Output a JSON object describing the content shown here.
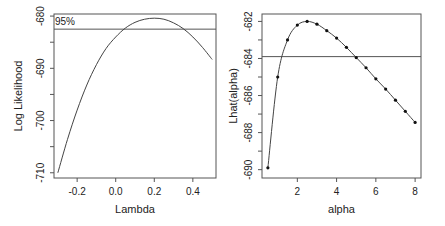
{
  "chart_data": [
    {
      "type": "line",
      "title": "",
      "xlabel": "Lambda",
      "ylabel": "Log Likelihood",
      "xlim": [
        -0.32,
        0.52
      ],
      "ylim": [
        -711,
        -679.6
      ],
      "xticks": [
        -0.2,
        0.0,
        0.2,
        0.4
      ],
      "xtick_labels": [
        "-0.2",
        "0.0",
        "0.2",
        "0.4"
      ],
      "yticks": [
        -680,
        -685,
        -690,
        -695,
        -700,
        -705,
        -710
      ],
      "ytick_labels": [
        "-680",
        "",
        "-690",
        "",
        "-700",
        "",
        "-710"
      ],
      "series": [
        {
          "name": "profile log-likelihood",
          "x": [
            -0.3,
            -0.25,
            -0.2,
            -0.15,
            -0.1,
            -0.05,
            0.0,
            0.05,
            0.1,
            0.15,
            0.2,
            0.25,
            0.3,
            0.35,
            0.4,
            0.45,
            0.5
          ],
          "y": [
            -710.0,
            -703.6,
            -698.0,
            -693.2,
            -689.3,
            -686.2,
            -684.0,
            -682.3,
            -681.2,
            -680.6,
            -680.4,
            -680.6,
            -681.3,
            -682.4,
            -684.0,
            -686.0,
            -688.3
          ]
        }
      ],
      "hline": {
        "y": -682.5,
        "label": "95%"
      },
      "grid": false
    },
    {
      "type": "line",
      "title": "",
      "xlabel": "alpha",
      "ylabel": "Lhat(alpha)",
      "xlim": [
        0.2,
        8.3
      ],
      "ylim": [
        -690.45,
        -681.6
      ],
      "xticks": [
        2,
        4,
        6,
        8
      ],
      "xtick_labels": [
        "2",
        "4",
        "6",
        "8"
      ],
      "yticks": [
        -682,
        -683,
        -684,
        -685,
        -686,
        -687,
        -688,
        -689,
        -690
      ],
      "ytick_labels": [
        "-682",
        "",
        "-684",
        "",
        "-686",
        "",
        "-688",
        "",
        "-690"
      ],
      "series": [
        {
          "name": "Lhat",
          "x": [
            0.5,
            1.0,
            1.5,
            2.0,
            2.5,
            3.0,
            3.5,
            4.0,
            4.5,
            5.0,
            5.5,
            6.0,
            6.5,
            7.0,
            7.5,
            8.0
          ],
          "y": [
            -689.9,
            -685.0,
            -683.0,
            -682.2,
            -682.0,
            -682.15,
            -682.5,
            -682.9,
            -683.4,
            -683.95,
            -684.5,
            -685.1,
            -685.65,
            -686.25,
            -686.85,
            -687.45
          ],
          "markers": true
        }
      ],
      "hline": {
        "y": -683.9,
        "label": ""
      },
      "grid": false
    }
  ]
}
